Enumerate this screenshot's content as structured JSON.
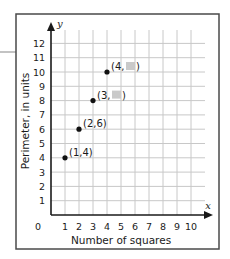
{
  "chart_data": {
    "type": "scatter",
    "title": "",
    "xlabel": "Number of squares",
    "ylabel": "Perimeter, in units",
    "x_axis_var": "x",
    "y_axis_var": "y",
    "xlim": [
      0,
      10
    ],
    "ylim": [
      0,
      12
    ],
    "origin_label": "0",
    "x_ticks": [
      "1",
      "2",
      "3",
      "4",
      "5",
      "6",
      "7",
      "8",
      "9",
      "10"
    ],
    "y_ticks": [
      "1",
      "2",
      "3",
      "4",
      "5",
      "6",
      "7",
      "8",
      "9",
      "10",
      "11",
      "12"
    ],
    "grid": true,
    "points": [
      {
        "x": 1,
        "y": 4,
        "label": "(1,4)",
        "hidden_y": false
      },
      {
        "x": 2,
        "y": 6,
        "label": "(2,6)",
        "hidden_y": false
      },
      {
        "x": 3,
        "y": 8,
        "label_prefix": "(3,",
        "label_suffix": ")",
        "hidden_y": true
      },
      {
        "x": 4,
        "y": 10,
        "label_prefix": "(4,",
        "label_suffix": ")",
        "hidden_y": true
      }
    ],
    "colors": {
      "axis": "#1a1a1a",
      "grid": "#c8c8c8",
      "frame": "#4a4a4a",
      "point": "#111111",
      "hidden_value_box": "#c9c9c9"
    }
  }
}
